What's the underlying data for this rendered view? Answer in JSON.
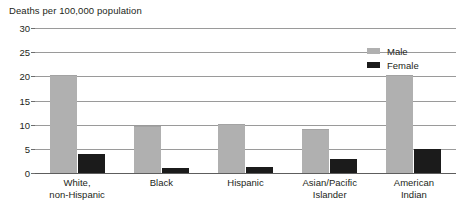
{
  "chart_data": {
    "type": "bar",
    "title": "Deaths per 100,000 population",
    "xlabel": "",
    "ylabel": "Deaths per 100,000 population",
    "ylim": [
      0,
      30
    ],
    "yticks": [
      0,
      5,
      10,
      15,
      20,
      25,
      30
    ],
    "ytick_labels": [
      "0",
      "5",
      "10",
      "15",
      "20",
      "25",
      "30"
    ],
    "grid": true,
    "legend_position": "top-right",
    "categories": [
      "White, non-Hispanic",
      "Black",
      "Hispanic",
      "Asian/Pacific Islander",
      "American Indian"
    ],
    "category_lines": [
      [
        "White,",
        "non-Hispanic"
      ],
      [
        "Black",
        ""
      ],
      [
        "Hispanic",
        ""
      ],
      [
        "Asian/Pacific",
        "Islander"
      ],
      [
        "American",
        "Indian"
      ]
    ],
    "series": [
      {
        "name": "Male",
        "color": "#b0b0b0",
        "values": [
          20.0,
          9.5,
          10.0,
          9.0,
          20.0
        ]
      },
      {
        "name": "Female",
        "color": "#1b1b1b",
        "values": [
          4.0,
          1.0,
          1.2,
          3.0,
          5.0
        ]
      }
    ]
  },
  "legend": {
    "items": [
      {
        "label": "Male"
      },
      {
        "label": "Female"
      }
    ]
  }
}
